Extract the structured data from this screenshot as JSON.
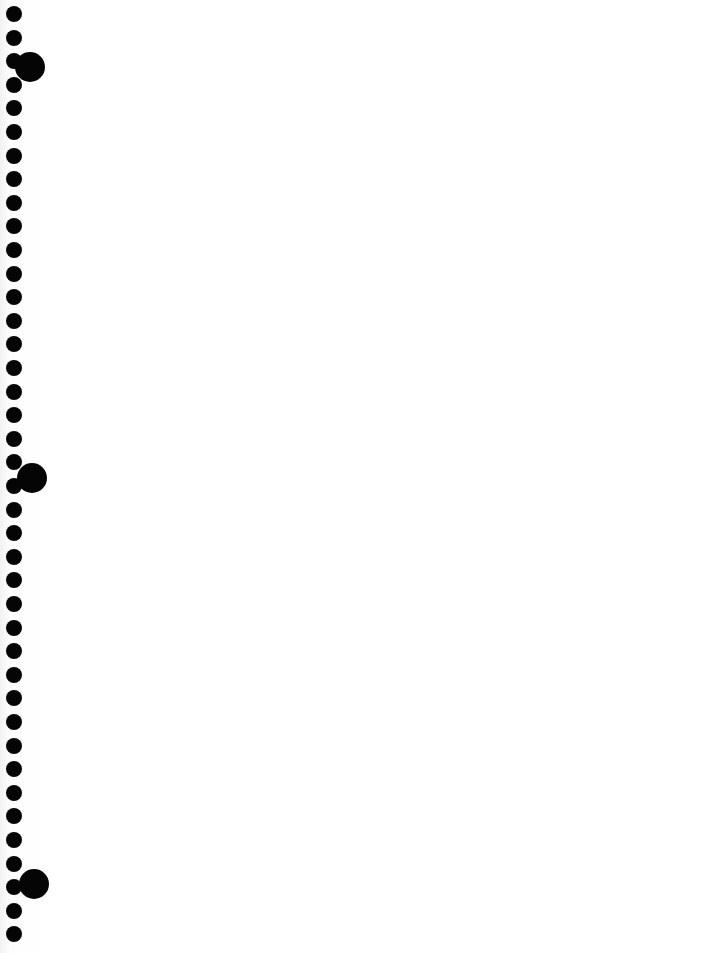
{
  "page": {
    "type": "blank-notebook-page",
    "background": "#ffffff",
    "hole_color": "#050505"
  },
  "binding": {
    "small_holes": {
      "x": 14,
      "start_y": 14,
      "spacing": 23.6,
      "count": 40,
      "diameter": 16
    },
    "large_holes": [
      {
        "x": 30,
        "y": 67,
        "diameter": 30
      },
      {
        "x": 32,
        "y": 478,
        "diameter": 30
      },
      {
        "x": 34,
        "y": 884,
        "diameter": 30
      }
    ]
  }
}
